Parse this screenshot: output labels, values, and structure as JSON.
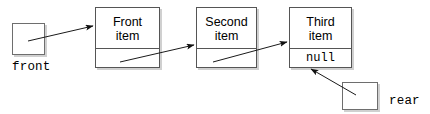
{
  "diagram": {
    "background_color": "#ffffff",
    "line_color": "#1a1a1a",
    "box_border_color": "#555555",
    "pointer_box_border_color": "#6e6e6e",
    "shadow_color": "#aaaaaa"
  },
  "pointers": [
    {
      "id": "front",
      "label": "front",
      "box": {
        "x": 12,
        "y": 23,
        "w": 33,
        "h": 32
      },
      "label_pos": {
        "x": 12,
        "y": 60
      }
    },
    {
      "id": "rear",
      "label": "rear",
      "box": {
        "x": 342,
        "y": 82,
        "w": 36,
        "h": 28
      },
      "label_pos": {
        "x": 389,
        "y": 94
      }
    }
  ],
  "nodes": [
    {
      "id": "node-1",
      "data_line1": "Front",
      "data_line2": "item",
      "link_text": "",
      "box": {
        "x": 95,
        "y": 7,
        "w": 65,
        "h": 61
      },
      "data_cell_height": 41
    },
    {
      "id": "node-2",
      "data_line1": "Second",
      "data_line2": "item",
      "link_text": "",
      "box": {
        "x": 196,
        "y": 7,
        "w": 61,
        "h": 61
      },
      "data_cell_height": 41
    },
    {
      "id": "node-3",
      "data_line1": "Third",
      "data_line2": "item",
      "link_text": "null",
      "box": {
        "x": 289,
        "y": 7,
        "w": 63,
        "h": 61
      },
      "data_cell_height": 41
    }
  ],
  "arrows": [
    {
      "id": "arrow-front-to-node1",
      "from": "front-box",
      "to": "node-1",
      "x1": 28,
      "y1": 41,
      "x2": 93,
      "y2": 26
    },
    {
      "id": "arrow-node1-to-node2",
      "from": "node-1-link",
      "to": "node-2",
      "x1": 120,
      "y1": 62,
      "x2": 194,
      "y2": 45
    },
    {
      "id": "arrow-node2-to-node3",
      "from": "node-2-link",
      "to": "node-3",
      "x1": 213,
      "y1": 62,
      "x2": 287,
      "y2": 42
    },
    {
      "id": "arrow-rear-to-node3",
      "from": "rear-box",
      "to": "node-3-link",
      "x1": 356,
      "y1": 95,
      "x2": 311,
      "y2": 69
    }
  ]
}
